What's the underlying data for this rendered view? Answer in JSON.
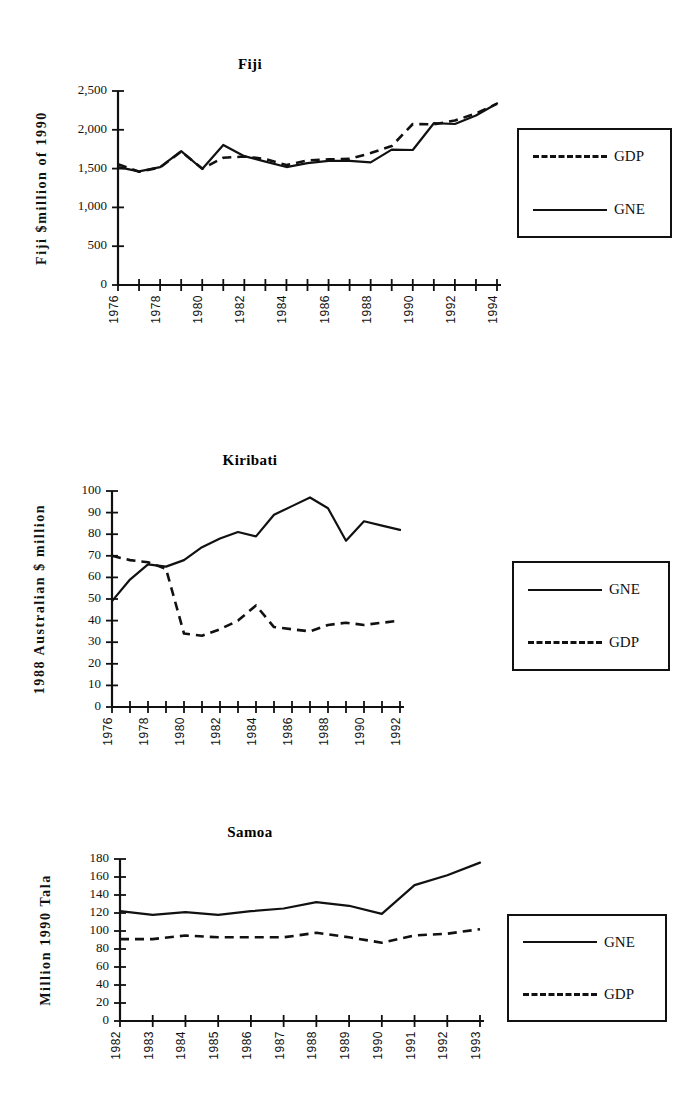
{
  "page": {
    "background": "#ffffff",
    "ink": "#111111"
  },
  "figures": [
    {
      "id": "fiji",
      "title": "Fiji",
      "ylabel": "Fiji  $million  of  1990",
      "legend": [
        {
          "label": "GDP",
          "style": "dashed"
        },
        {
          "label": "GNE",
          "style": "solid"
        }
      ]
    },
    {
      "id": "kiribati",
      "title": "Kiribati",
      "ylabel": "1988  Australian  $  million",
      "legend": [
        {
          "label": "GNE",
          "style": "solid"
        },
        {
          "label": "GDP",
          "style": "dashed"
        }
      ]
    },
    {
      "id": "samoa",
      "title": "Samoa",
      "ylabel": "Million  1990  Tala",
      "legend": [
        {
          "label": "GNE",
          "style": "solid"
        },
        {
          "label": "GDP",
          "style": "dashed"
        }
      ]
    }
  ],
  "chart_data": [
    {
      "type": "line",
      "id": "fiji",
      "title": "Fiji",
      "xlabel": "",
      "ylabel": "Fiji $million of 1990",
      "ylim": [
        0,
        2500
      ],
      "yticks": [
        0,
        500,
        1000,
        1500,
        2000,
        2500
      ],
      "ytick_labels": [
        "0",
        "500",
        "1,000",
        "1,500",
        "2,000",
        "2,500"
      ],
      "x": [
        1976,
        1977,
        1978,
        1979,
        1980,
        1981,
        1982,
        1983,
        1984,
        1985,
        1986,
        1987,
        1988,
        1989,
        1990,
        1991,
        1992,
        1993,
        1994
      ],
      "xtick_labels": [
        "1976",
        "",
        "1978",
        "",
        "1980",
        "",
        "1982",
        "",
        "1984",
        "",
        "1986",
        "",
        "1988",
        "",
        "1990",
        "",
        "1992",
        "",
        "1994"
      ],
      "grid": false,
      "legend_position": "right",
      "series": [
        {
          "name": "GDP",
          "style": "dashed",
          "values": [
            1555,
            1460,
            1515,
            1720,
            1500,
            1640,
            1655,
            1625,
            1545,
            1605,
            1620,
            1625,
            1700,
            1790,
            2075,
            2070,
            2120,
            2210,
            2335
          ]
        },
        {
          "name": "GNE",
          "style": "solid",
          "values": [
            1520,
            1465,
            1520,
            1725,
            1495,
            1805,
            1660,
            1590,
            1520,
            1570,
            1600,
            1600,
            1580,
            1745,
            1740,
            2085,
            2075,
            2185,
            2340
          ]
        }
      ]
    },
    {
      "type": "line",
      "id": "kiribati",
      "title": "Kiribati",
      "xlabel": "",
      "ylabel": "1988 Australian $ million",
      "ylim": [
        0,
        100
      ],
      "yticks": [
        0,
        10,
        20,
        30,
        40,
        50,
        60,
        70,
        80,
        90,
        100
      ],
      "ytick_labels": [
        "0",
        "10",
        "20",
        "30",
        "40",
        "50",
        "60",
        "70",
        "80",
        "90",
        "100"
      ],
      "x": [
        1976,
        1977,
        1978,
        1979,
        1980,
        1981,
        1982,
        1983,
        1984,
        1985,
        1986,
        1987,
        1988,
        1989,
        1990,
        1991,
        1992
      ],
      "xtick_labels": [
        "1976",
        "",
        "1978",
        "",
        "1980",
        "",
        "1982",
        "",
        "1984",
        "",
        "1986",
        "",
        "1988",
        "",
        "1990",
        "",
        "1992"
      ],
      "grid": false,
      "legend_position": "right",
      "series": [
        {
          "name": "GNE",
          "style": "solid",
          "values": [
            49,
            59,
            66,
            65,
            68,
            74,
            78,
            81,
            79,
            89,
            93,
            97,
            92,
            77,
            86,
            84,
            82
          ]
        },
        {
          "name": "GDP",
          "style": "dashed",
          "values": [
            70,
            68,
            67,
            64,
            34,
            33,
            36,
            40,
            47,
            37,
            36,
            35,
            38,
            39,
            38,
            39,
            40
          ]
        }
      ]
    },
    {
      "type": "line",
      "id": "samoa",
      "title": "Samoa",
      "xlabel": "",
      "ylabel": "Million 1990 Tala",
      "ylim": [
        0,
        180
      ],
      "yticks": [
        0,
        20,
        40,
        60,
        80,
        100,
        120,
        140,
        160,
        180
      ],
      "ytick_labels": [
        "0",
        "20",
        "40",
        "60",
        "80",
        "100",
        "120",
        "140",
        "160",
        "180"
      ],
      "x": [
        1982,
        1983,
        1984,
        1985,
        1986,
        1987,
        1988,
        1989,
        1990,
        1991,
        1992,
        1993
      ],
      "xtick_labels": [
        "1982",
        "1983",
        "1984",
        "1985",
        "1986",
        "1987",
        "1988",
        "1989",
        "1990",
        "1991",
        "1992",
        "1993"
      ],
      "grid": false,
      "legend_position": "right",
      "series": [
        {
          "name": "GNE",
          "style": "solid",
          "values": [
            122,
            118,
            121,
            118,
            122,
            125,
            132,
            128,
            119,
            151,
            162,
            176
          ]
        },
        {
          "name": "GDP",
          "style": "dashed",
          "values": [
            91,
            91,
            95,
            93,
            93,
            93,
            98,
            93,
            87,
            95,
            97,
            102
          ]
        }
      ]
    }
  ]
}
